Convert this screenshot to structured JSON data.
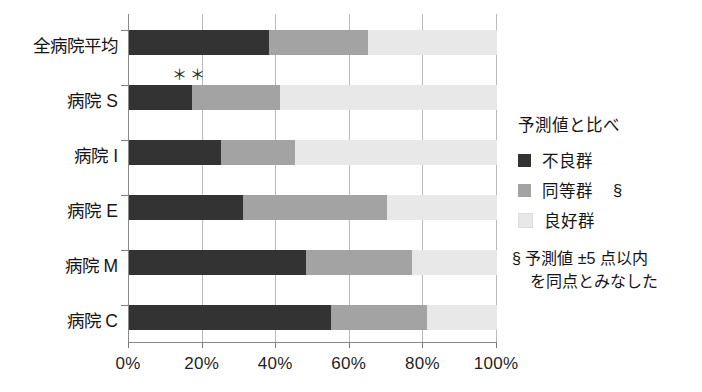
{
  "chart_data": {
    "type": "bar",
    "orientation": "horizontal",
    "stacked": true,
    "stack_mode": "percent",
    "title": "",
    "xlabel": "",
    "ylabel": "",
    "xlim": [
      0,
      100
    ],
    "grid": true,
    "legend_position": "right",
    "categories": [
      "全病院平均",
      "病院 S",
      "病院 I",
      "病院 E",
      "病院 M",
      "病院 C"
    ],
    "xticks": [
      0,
      20,
      40,
      60,
      80,
      100
    ],
    "xtick_labels": [
      "0%",
      "20%",
      "40%",
      "60%",
      "80%",
      "100%"
    ],
    "series": [
      {
        "name": "不良群",
        "color": "#333333",
        "values": [
          38,
          17,
          25,
          31,
          48,
          55
        ]
      },
      {
        "name": "同等群",
        "color": "#a3a3a3",
        "values": [
          27,
          24,
          20,
          39,
          29,
          26
        ]
      },
      {
        "name": "良好群",
        "color": "#e8e8e8",
        "values": [
          35,
          59,
          55,
          30,
          23,
          19
        ]
      }
    ],
    "annotations": [
      {
        "text": "＊＊",
        "category": "病院 S",
        "x_percent": 12
      }
    ]
  },
  "legend": {
    "title": "予測値と比べ",
    "items": [
      {
        "label": "不良群",
        "color": "#333333",
        "marker": ""
      },
      {
        "label": "同等群",
        "color": "#a3a3a3",
        "marker": "§"
      },
      {
        "label": "良好群",
        "color": "#e8e8e8",
        "marker": ""
      }
    ],
    "note_line1": "§ 予測値 ±5 点以内",
    "note_line2": "を同点とみなした"
  }
}
